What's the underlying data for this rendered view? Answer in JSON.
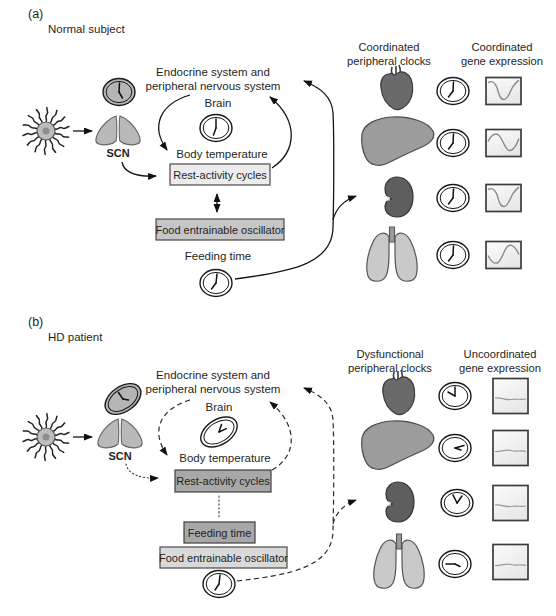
{
  "panel_a": {
    "tag": "(a)",
    "subject": "Normal subject",
    "endocrine_line1": "Endocrine system and",
    "endocrine_line2": "peripheral nervous system",
    "brain": "Brain",
    "scn": "SCN",
    "body_temperature": "Body temperature",
    "rest_activity": "Rest-activity cycles",
    "food_oscillator": "Food entrainable oscillator",
    "feeding_time": "Feeding time",
    "clocks_header_line1": "Coordinated",
    "clocks_header_line2": "peripheral clocks",
    "expression_header_line1": "Coordinated",
    "expression_header_line2": "gene expression"
  },
  "panel_b": {
    "tag": "(b)",
    "subject": "HD patient",
    "endocrine_line1": "Endocrine system and",
    "endocrine_line2": "peripheral nervous system",
    "brain": "Brain",
    "scn": "SCN",
    "body_temperature": "Body temperature",
    "rest_activity": "Rest-activity cycles",
    "feeding_time": "Feeding time",
    "food_oscillator": "Food entrainable oscillator",
    "clocks_header_line1": "Dysfunctional",
    "clocks_header_line2": "peripheral clocks",
    "expression_header_line1": "Uncoordinated",
    "expression_header_line2": "gene expression"
  },
  "icons": {
    "sun": "sun-icon",
    "scn": "scn-nuclei-icon",
    "clock": "analog-clock-icon",
    "tilted_clock": "tilted-clock-icon",
    "organs": [
      "heart",
      "liver",
      "kidney",
      "lungs"
    ]
  },
  "colors": {
    "heart": "#6a6a6a",
    "liver": "#9c9c9c",
    "kidney": "#5e5e5e",
    "lungs": "#c9c9c9",
    "scn": "#b9b9b9",
    "box_light": "#ececec",
    "box_mid": "#c6c6c6",
    "box_dark": "#a8a8a8",
    "feo_light": "#d9d9d9",
    "clock_face_white": "#ffffff",
    "clock_face_gray": "#b5b5b5",
    "line": "#1a1a1a"
  }
}
